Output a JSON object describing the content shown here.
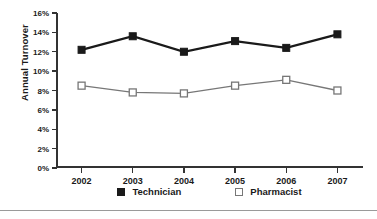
{
  "chart_data": {
    "type": "line",
    "title": "",
    "xlabel": "",
    "ylabel": "Annual Turnover",
    "categories": [
      "2002",
      "2003",
      "2004",
      "2005",
      "2006",
      "2007"
    ],
    "series": [
      {
        "name": "Technician",
        "values": [
          12.2,
          13.6,
          12.0,
          13.1,
          12.4,
          13.8
        ],
        "color": "#1a1a1a",
        "marker": "filled-square"
      },
      {
        "name": "Pharmacist",
        "values": [
          8.5,
          7.8,
          7.7,
          8.5,
          9.1,
          8.0
        ],
        "color": "#777777",
        "marker": "open-square"
      }
    ],
    "ylim": [
      0,
      16
    ],
    "ytick_values": [
      0,
      2,
      4,
      6,
      8,
      10,
      12,
      14,
      16
    ],
    "ytick_labels": [
      "0%",
      "2%",
      "4%",
      "6%",
      "8%",
      "10%",
      "12%",
      "14%",
      "16%"
    ],
    "grid": false,
    "legend_position": "bottom"
  },
  "legend": {
    "entries": [
      {
        "label": "Technician",
        "swatch": "filled-square-icon"
      },
      {
        "label": "Pharmacist",
        "swatch": "open-square-icon"
      }
    ]
  }
}
